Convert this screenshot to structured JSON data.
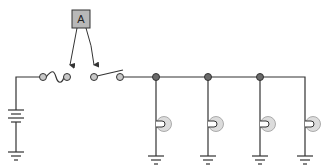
{
  "diagram": {
    "type": "circuit-schematic",
    "meter": {
      "label": "A",
      "fill": "#b8b8b8",
      "stroke": "#333333"
    },
    "components": [
      {
        "kind": "battery"
      },
      {
        "kind": "fuse"
      },
      {
        "kind": "switch",
        "state": "open"
      },
      {
        "kind": "junction",
        "count": 3
      },
      {
        "kind": "lamp",
        "count": 4
      },
      {
        "kind": "ground",
        "count": 5
      }
    ],
    "colors": {
      "wire": "#333333",
      "terminal": "#c8c8c8",
      "junction": "#6a6a6a",
      "lamp_outer": "#dcdcdc",
      "lamp_inner": "#ffffff"
    }
  }
}
